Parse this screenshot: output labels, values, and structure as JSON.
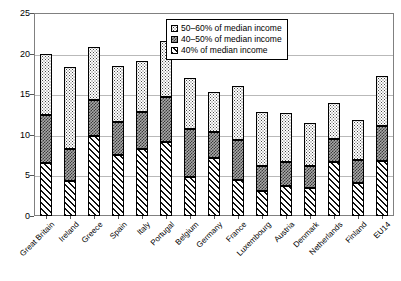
{
  "chart_data": {
    "type": "bar",
    "subtype": "stacked-vertical",
    "title": "",
    "subtitle": "",
    "xlabel": "",
    "ylabel": "",
    "ylim": [
      0,
      25
    ],
    "yticks": [
      0,
      5,
      10,
      15,
      20,
      25
    ],
    "ytick_labels": [
      "0",
      "5",
      "10",
      "15",
      "20",
      "25"
    ],
    "grid": true,
    "grid_axis": "y",
    "legend_position": "top-center-inside",
    "stack_order_bottom_to_top": [
      "40% of median income",
      "40–50% of median income",
      "50–60% of median income"
    ],
    "categories": [
      "Great Britain",
      "Ireland",
      "Greece",
      "Spain",
      "Italy",
      "Portugal",
      "Belgium",
      "Germany",
      "France",
      "Luxembourg",
      "Austria",
      "Denmark",
      "Netherlands",
      "Finland",
      "EU14"
    ],
    "series": [
      {
        "name": "40% of median income",
        "pattern": "diagonal-hatch",
        "color": "#ffffff",
        "values": [
          6.5,
          4.3,
          9.9,
          7.5,
          8.2,
          9.1,
          4.8,
          7.1,
          4.4,
          3.1,
          3.7,
          3.4,
          6.7,
          4.1,
          6.8
        ]
      },
      {
        "name": "40–50% of median income",
        "pattern": "checker",
        "color": "#a8a8a8",
        "values": [
          5.9,
          4.0,
          4.4,
          4.1,
          4.6,
          5.6,
          5.9,
          3.2,
          4.9,
          3.1,
          3.0,
          2.8,
          2.8,
          2.8,
          4.3
        ]
      },
      {
        "name": "50–60% of median income",
        "pattern": "dotted",
        "color": "#ffffff",
        "values": [
          7.5,
          10.1,
          6.5,
          6.9,
          6.3,
          6.9,
          6.3,
          5.0,
          6.7,
          6.6,
          6.0,
          5.3,
          4.4,
          4.9,
          6.2
        ]
      }
    ],
    "totals": [
      19.9,
      18.4,
      20.8,
      18.5,
      19.1,
      21.6,
      17.0,
      15.3,
      16.0,
      12.8,
      12.7,
      11.5,
      13.9,
      11.8,
      17.3
    ],
    "cumulative_boundaries": {
      "after_40pct": [
        6.5,
        4.3,
        9.9,
        7.5,
        8.2,
        9.1,
        4.8,
        7.1,
        4.4,
        3.1,
        3.7,
        3.4,
        6.7,
        4.1,
        6.8
      ],
      "after_40_50": [
        12.4,
        8.3,
        14.3,
        11.6,
        12.8,
        14.7,
        10.7,
        10.3,
        9.3,
        6.2,
        6.7,
        6.2,
        9.5,
        6.9,
        11.1
      ],
      "after_50_60": [
        19.9,
        18.4,
        20.8,
        18.5,
        19.1,
        21.6,
        17.0,
        15.3,
        16.0,
        12.8,
        12.7,
        11.5,
        13.9,
        11.8,
        17.3
      ]
    }
  },
  "legend": {
    "items": [
      {
        "label": "50–60% of median income",
        "swatch": "dotted"
      },
      {
        "label": "40–50% of median income",
        "swatch": "checker"
      },
      {
        "label": "40% of median income",
        "swatch": "hatch"
      }
    ]
  },
  "colors": {
    "axis": "#808080",
    "grid": "#b9b9b9",
    "text": "#000000",
    "segment_mid_fill": "#a8a8a8",
    "background": "#ffffff"
  }
}
